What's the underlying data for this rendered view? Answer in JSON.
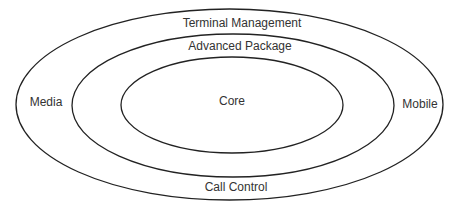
{
  "diagram": {
    "type": "nested-ellipses",
    "stroke_color": "#222222",
    "text_color": "#333333",
    "layers": [
      {
        "name": "outer",
        "cx": 229.5,
        "cy": 104.5,
        "rx": 213.5,
        "ry": 95.5
      },
      {
        "name": "middle",
        "cx": 233,
        "cy": 105.5,
        "rx": 161,
        "ry": 71.5
      },
      {
        "name": "inner",
        "cx": 232,
        "cy": 105,
        "rx": 111,
        "ry": 48
      }
    ],
    "labels": {
      "top_outer": "Terminal Management",
      "top_middle": "Advanced Package",
      "center": "Core",
      "left": "Media",
      "right": "Mobile",
      "bottom": "Call Control"
    }
  }
}
